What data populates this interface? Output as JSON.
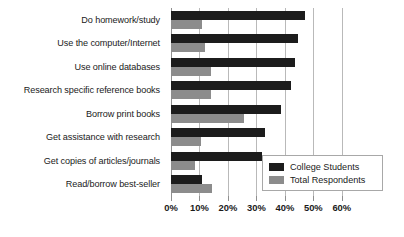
{
  "chart_data": {
    "type": "bar",
    "orientation": "horizontal",
    "title": "",
    "xlabel": "",
    "ylabel": "",
    "xlim": [
      0,
      65
    ],
    "grid": true,
    "legend_position": "inside-bottom-right",
    "tick_labels": [
      "0%",
      "10%",
      "20%",
      "30%",
      "40%",
      "50%",
      "60%"
    ],
    "tick_values": [
      0,
      10,
      20,
      30,
      40,
      50,
      60
    ],
    "categories": [
      "Do homework/study",
      "Use the computer/Internet",
      "Use online databases",
      "Research specific reference books",
      "Borrow print books",
      "Get assistance with research",
      "Get copies of articles/journals",
      "Read/borrow best-seller"
    ],
    "series": [
      {
        "name": "College Students",
        "color": "#1c1c1c",
        "values": [
          47,
          44.5,
          43.5,
          42,
          38.5,
          33,
          32,
          11
        ]
      },
      {
        "name": "Total Respondents",
        "color": "#8c8c8c",
        "values": [
          11,
          12,
          14,
          14,
          25.5,
          10.5,
          8.5,
          14.5
        ]
      }
    ]
  },
  "legend": {
    "entries": [
      {
        "label": "College Students"
      },
      {
        "label": "Total Respondents"
      }
    ]
  }
}
